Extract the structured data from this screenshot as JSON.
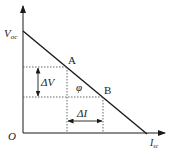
{
  "diagram": {
    "type": "iv-line-diagram",
    "axes": {
      "y_label_main": "V",
      "y_label_sub": "oc",
      "x_label_main": "I",
      "x_label_sub": "sc",
      "origin_label": "O"
    },
    "points": {
      "a_label": "A",
      "b_label": "B"
    },
    "annotations": {
      "delta_v": "ΔV",
      "delta_i": "ΔI",
      "angle": "φ"
    },
    "colors": {
      "line": "#1a1a1a",
      "dashed": "#555555",
      "text": "#222222"
    }
  }
}
